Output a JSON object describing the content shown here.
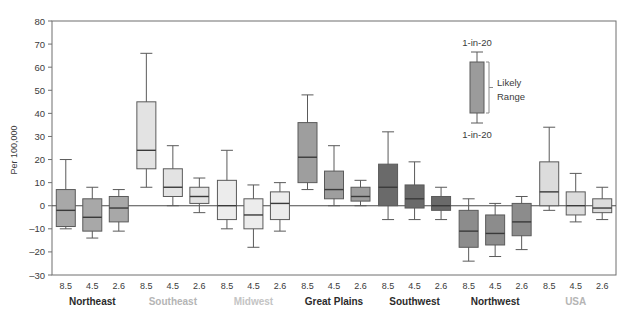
{
  "chart_data": {
    "type": "box",
    "title": "",
    "xlabel": "",
    "ylabel": "Per 100,000",
    "ylim": [
      -30,
      80
    ],
    "yticks": [
      -30,
      -20,
      -10,
      0,
      10,
      20,
      30,
      40,
      50,
      60,
      70,
      80
    ],
    "ytick_labels": [
      "–30",
      "–20",
      "–10",
      "0",
      "10",
      "20",
      "30",
      "40",
      "50",
      "60",
      "70",
      "80"
    ],
    "grid": false,
    "zero_line": 0,
    "scenario_labels": [
      "8.5",
      "4.5",
      "2.6"
    ],
    "legend": {
      "position": "inside-top-right",
      "top_label": "1-in-20",
      "bottom_label": "1-in-20",
      "middle_label_line1": "Likely",
      "middle_label_line2": "Range",
      "box_fill": "#9b9b9b"
    },
    "groups": [
      {
        "name": "Northeast",
        "label_color": "#2b2b2b",
        "box_fill": "#a8a8a8",
        "boxes": [
          {
            "scenario": "8.5",
            "whisker_low": -10,
            "q1": -9,
            "median": -2,
            "q3": 7,
            "whisker_high": 20
          },
          {
            "scenario": "4.5",
            "whisker_low": -14,
            "q1": -11,
            "median": -5,
            "q3": 3,
            "whisker_high": 8
          },
          {
            "scenario": "2.6",
            "whisker_low": -11,
            "q1": -7,
            "median": -1,
            "q3": 4,
            "whisker_high": 7
          }
        ]
      },
      {
        "name": "Southeast",
        "label_color": "#b5b5b5",
        "box_fill": "#e3e3e3",
        "boxes": [
          {
            "scenario": "8.5",
            "whisker_low": 8,
            "q1": 16,
            "median": 24,
            "q3": 45,
            "whisker_high": 66
          },
          {
            "scenario": "4.5",
            "whisker_low": 0,
            "q1": 4,
            "median": 8,
            "q3": 16,
            "whisker_high": 26
          },
          {
            "scenario": "2.6",
            "whisker_low": -3,
            "q1": 1,
            "median": 4,
            "q3": 8,
            "whisker_high": 12
          }
        ]
      },
      {
        "name": "Midwest",
        "label_color": "#c4c4c4",
        "box_fill": "#ececec",
        "boxes": [
          {
            "scenario": "8.5",
            "whisker_low": -10,
            "q1": -6,
            "median": 0,
            "q3": 11,
            "whisker_high": 24
          },
          {
            "scenario": "4.5",
            "whisker_low": -18,
            "q1": -10,
            "median": -4,
            "q3": 3,
            "whisker_high": 9
          },
          {
            "scenario": "2.6",
            "whisker_low": -11,
            "q1": -6,
            "median": 1,
            "q3": 6,
            "whisker_high": 10
          }
        ]
      },
      {
        "name": "Great Plains",
        "label_color": "#2b2b2b",
        "box_fill": "#9e9e9e",
        "boxes": [
          {
            "scenario": "8.5",
            "whisker_low": 7,
            "q1": 10,
            "median": 21,
            "q3": 36,
            "whisker_high": 48
          },
          {
            "scenario": "4.5",
            "whisker_low": 0,
            "q1": 3,
            "median": 7,
            "q3": 15,
            "whisker_high": 26
          },
          {
            "scenario": "2.6",
            "whisker_low": 0,
            "q1": 2,
            "median": 4,
            "q3": 8,
            "whisker_high": 11
          }
        ]
      },
      {
        "name": "Southwest",
        "label_color": "#2b2b2b",
        "box_fill": "#6a6a6a",
        "boxes": [
          {
            "scenario": "8.5",
            "whisker_low": -6,
            "q1": 0,
            "median": 8,
            "q3": 18,
            "whisker_high": 32
          },
          {
            "scenario": "4.5",
            "whisker_low": -6,
            "q1": -1,
            "median": 3,
            "q3": 9,
            "whisker_high": 19
          },
          {
            "scenario": "2.6",
            "whisker_low": -6,
            "q1": -2,
            "median": 0,
            "q3": 4,
            "whisker_high": 8
          }
        ]
      },
      {
        "name": "Northwest",
        "label_color": "#2b2b2b",
        "box_fill": "#8c8c8c",
        "boxes": [
          {
            "scenario": "8.5",
            "whisker_low": -24,
            "q1": -18,
            "median": -11,
            "q3": -2,
            "whisker_high": 3
          },
          {
            "scenario": "4.5",
            "whisker_low": -22,
            "q1": -17,
            "median": -12,
            "q3": -4,
            "whisker_high": 1
          },
          {
            "scenario": "2.6",
            "whisker_low": -19,
            "q1": -13,
            "median": -7,
            "q3": 1,
            "whisker_high": 4
          }
        ]
      },
      {
        "name": "USA",
        "label_color": "#b5b5b5",
        "box_fill": "#dcdcdc",
        "boxes": [
          {
            "scenario": "8.5",
            "whisker_low": -2,
            "q1": 0,
            "median": 6,
            "q3": 19,
            "whisker_high": 34
          },
          {
            "scenario": "4.5",
            "whisker_low": -7,
            "q1": -4,
            "median": 0,
            "q3": 6,
            "whisker_high": 14
          },
          {
            "scenario": "2.6",
            "whisker_low": -6,
            "q1": -3,
            "median": -1,
            "q3": 3,
            "whisker_high": 8
          }
        ]
      }
    ]
  }
}
